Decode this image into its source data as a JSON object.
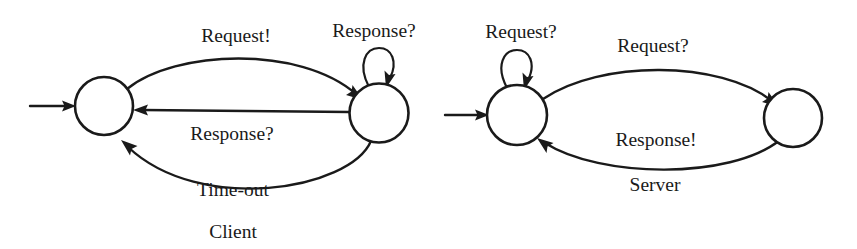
{
  "diagram": {
    "type": "finite-state-machine-pair",
    "background_color": "#ffffff",
    "stroke_color": "#1a1a1a",
    "machines": [
      {
        "name": "Client",
        "caption": "Client",
        "states": [
          {
            "id": "client-s0",
            "label": "",
            "cx": 104,
            "cy": 106,
            "r": 29,
            "initial": true
          },
          {
            "id": "client-s1",
            "label": "",
            "cx": 379,
            "cy": 113,
            "r": 29.5,
            "initial": false
          }
        ],
        "transitions": [
          {
            "id": "client-request",
            "from": "client-s0",
            "to": "client-s1",
            "label": "Request!",
            "label_x": 236,
            "label_y": 42,
            "shape": "arc-above"
          },
          {
            "id": "client-response",
            "from": "client-s1",
            "to": "client-s0",
            "label": "Response?",
            "label_x": 232,
            "label_y": 140,
            "shape": "straight"
          },
          {
            "id": "client-timeout",
            "from": "client-s1",
            "to": "client-s0",
            "label": "Time-out",
            "label_x": 233,
            "label_y": 196,
            "shape": "arc-below"
          },
          {
            "id": "client-self-response",
            "from": "client-s1",
            "to": "client-s1",
            "label": "Response?",
            "label_x": 374,
            "label_y": 37,
            "shape": "self-loop"
          }
        ]
      },
      {
        "name": "Server",
        "caption": "Server",
        "states": [
          {
            "id": "server-s0",
            "label": "",
            "cx": 517,
            "cy": 115,
            "r": 30,
            "initial": true
          },
          {
            "id": "server-s1",
            "label": "",
            "cx": 793,
            "cy": 118,
            "r": 29,
            "initial": false
          }
        ],
        "transitions": [
          {
            "id": "server-self-request",
            "from": "server-s0",
            "to": "server-s0",
            "label": "Request?",
            "label_x": 521,
            "label_y": 38,
            "shape": "self-loop"
          },
          {
            "id": "server-request",
            "from": "server-s0",
            "to": "server-s1",
            "label": "Request?",
            "label_x": 653,
            "label_y": 52,
            "shape": "arc-above"
          },
          {
            "id": "server-response",
            "from": "server-s1",
            "to": "server-s0",
            "label": "Response!",
            "label_x": 656,
            "label_y": 146,
            "shape": "arc-below"
          }
        ]
      }
    ],
    "captions": [
      {
        "id": "caption-client",
        "text": "Client",
        "x": 233,
        "y": 238
      },
      {
        "id": "caption-server",
        "text": "Server",
        "x": 655,
        "y": 191
      }
    ]
  }
}
